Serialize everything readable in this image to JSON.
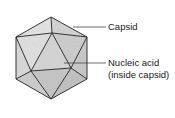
{
  "diagram": {
    "labels": {
      "capsid": "Capsid",
      "nucleic_acid_line1": "Nucleic acid",
      "nucleic_acid_line2": "(inside capsid)"
    },
    "colors": {
      "face_light": "#e4e4e4",
      "face_mid": "#d2d2d2",
      "face_dark": "#c4c4c4",
      "edge": "#222222",
      "leader": "#444444"
    }
  }
}
